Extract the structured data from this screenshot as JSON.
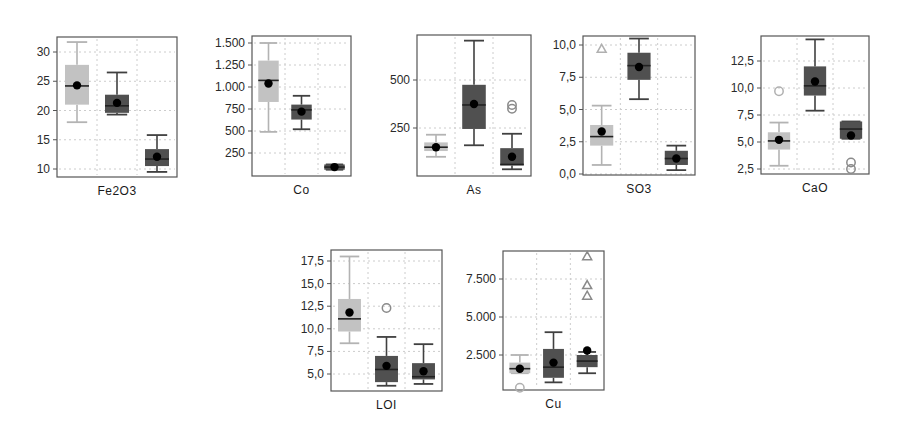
{
  "figure": {
    "width": 898,
    "height": 432,
    "background": "#ffffff",
    "colors": {
      "light_box": "#c2c2c2",
      "light_whisker": "#b3b3b3",
      "dark_box": "#505050",
      "dark_whisker": "#404040",
      "median": "#222222",
      "mean_dot": "#000000",
      "frame": "#555555",
      "grid": "#cccccc",
      "outlier_light": "#b0b0b0",
      "outlier_dark": "#8a8a8a"
    }
  },
  "chart_data": [
    {
      "type": "box",
      "title": "",
      "xlabel": "Fe2O3",
      "ylabel": "",
      "yticks": [
        10,
        15,
        20,
        25,
        30
      ],
      "ytick_labels": [
        "10",
        "15",
        "20",
        "25",
        "30"
      ],
      "ylim": [
        9,
        32.5
      ],
      "grid": true,
      "frame": {
        "x": 57,
        "y": 37,
        "w": 120,
        "h": 140
      },
      "scale": {
        "v0": 10,
        "y0": 169,
        "v1": 30,
        "y1": 52
      },
      "groups": [
        {
          "name": "group-1",
          "shade": "light",
          "whisker_low": 18,
          "q1": 21,
          "median": 24.2,
          "q3": 27.8,
          "whisker_high": 31.7,
          "mean": 24.3,
          "outliers": []
        },
        {
          "name": "group-2",
          "shade": "dark",
          "whisker_low": 19.3,
          "q1": 19.6,
          "median": 20.8,
          "q3": 22.7,
          "whisker_high": 26.5,
          "mean": 21.3,
          "outliers": []
        },
        {
          "name": "group-3",
          "shade": "dark",
          "whisker_low": 9.5,
          "q1": 10.5,
          "median": 11.7,
          "q3": 13.4,
          "whisker_high": 15.8,
          "mean": 12.1,
          "outliers": []
        }
      ]
    },
    {
      "type": "box",
      "xlabel": "Co",
      "ylabel": "",
      "yticks": [
        250,
        500,
        750,
        1000,
        1250,
        1500
      ],
      "ytick_labels": [
        "250",
        "500",
        "750",
        "1.000",
        "1.250",
        "1.500"
      ],
      "ylim": [
        0,
        1550
      ],
      "grid": true,
      "frame": {
        "x": 252,
        "y": 36,
        "w": 99,
        "h": 140
      },
      "scale": {
        "v0": 250,
        "y0": 153,
        "v1": 1500,
        "y1": 43
      },
      "groups": [
        {
          "name": "group-1",
          "shade": "light",
          "whisker_low": 490,
          "q1": 830,
          "median": 1075,
          "q3": 1300,
          "whisker_high": 1500,
          "mean": 1040,
          "outliers": []
        },
        {
          "name": "group-2",
          "shade": "dark",
          "whisker_low": 520,
          "q1": 630,
          "median": 740,
          "q3": 800,
          "whisker_high": 900,
          "mean": 720,
          "outliers": []
        },
        {
          "name": "group-3",
          "shade": "dark",
          "whisker_low": 60,
          "q1": 60,
          "median": 90,
          "q3": 120,
          "whisker_high": 120,
          "mean": 90,
          "outliers": []
        }
      ]
    },
    {
      "type": "box",
      "xlabel": "As",
      "ylabel": "",
      "yticks": [
        250,
        500
      ],
      "ytick_labels": [
        "250",
        "500"
      ],
      "ylim": [
        0,
        720
      ],
      "grid": true,
      "frame": {
        "x": 417,
        "y": 35,
        "w": 114,
        "h": 141
      },
      "scale": {
        "v0": 250,
        "y0": 128,
        "v1": 500,
        "y1": 80
      },
      "groups": [
        {
          "name": "group-1",
          "shade": "light",
          "whisker_low": 100,
          "q1": 130,
          "median": 150,
          "q3": 175,
          "whisker_high": 215,
          "mean": 150,
          "outliers": []
        },
        {
          "name": "group-2",
          "shade": "dark",
          "whisker_low": 160,
          "q1": 245,
          "median": 370,
          "q3": 475,
          "whisker_high": 705,
          "mean": 375,
          "outliers": []
        },
        {
          "name": "group-3",
          "shade": "dark",
          "whisker_low": 35,
          "q1": 55,
          "median": 60,
          "q3": 145,
          "whisker_high": 220,
          "mean": 100,
          "outliers": [
            {
              "value": 350,
              "shape": "circle"
            },
            {
              "value": 370,
              "shape": "circle"
            }
          ]
        }
      ]
    },
    {
      "type": "box",
      "xlabel": "SO3",
      "ylabel": "",
      "yticks": [
        0,
        2.5,
        5,
        7.5,
        10
      ],
      "ytick_labels": [
        "0,0",
        "2,5",
        "5,0",
        "7,5",
        "10,0"
      ],
      "ylim": [
        0,
        10.6
      ],
      "grid": true,
      "frame": {
        "x": 583,
        "y": 36,
        "w": 112,
        "h": 139
      },
      "scale": {
        "v0": 0,
        "y0": 174,
        "v1": 10,
        "y1": 45
      },
      "groups": [
        {
          "name": "group-1",
          "shade": "light",
          "whisker_low": 0.7,
          "q1": 2.2,
          "median": 2.9,
          "q3": 3.8,
          "whisker_high": 5.3,
          "mean": 3.3,
          "outliers": [
            {
              "value": 9.7,
              "shape": "triangle"
            }
          ]
        },
        {
          "name": "group-2",
          "shade": "dark",
          "whisker_low": 5.8,
          "q1": 7.3,
          "median": 8.4,
          "q3": 9.4,
          "whisker_high": 10.5,
          "mean": 8.3,
          "outliers": []
        },
        {
          "name": "group-3",
          "shade": "dark",
          "whisker_low": 0.3,
          "q1": 0.7,
          "median": 1.2,
          "q3": 1.8,
          "whisker_high": 2.2,
          "mean": 1.2,
          "outliers": []
        }
      ]
    },
    {
      "type": "box",
      "xlabel": "CaO",
      "ylabel": "",
      "yticks": [
        2.5,
        5,
        7.5,
        10,
        12.5
      ],
      "ytick_labels": [
        "2,5",
        "5,0",
        "7,5",
        "10,0",
        "12,5"
      ],
      "ylim": [
        2.2,
        14.8
      ],
      "grid": true,
      "frame": {
        "x": 761,
        "y": 36,
        "w": 108,
        "h": 138
      },
      "scale": {
        "v0": 2.5,
        "y0": 169,
        "v1": 12.5,
        "y1": 61
      },
      "groups": [
        {
          "name": "group-1",
          "shade": "light",
          "whisker_low": 2.8,
          "q1": 4.3,
          "median": 5.1,
          "q3": 5.9,
          "whisker_high": 6.8,
          "mean": 5.2,
          "outliers": [
            {
              "value": 9.7,
              "shape": "circle"
            }
          ]
        },
        {
          "name": "group-2",
          "shade": "dark",
          "whisker_low": 7.9,
          "q1": 9.3,
          "median": 10.2,
          "q3": 12.0,
          "whisker_high": 14.5,
          "mean": 10.6,
          "outliers": []
        },
        {
          "name": "group-3",
          "shade": "dark",
          "whisker_low": 5.3,
          "q1": 5.3,
          "median": 6.2,
          "q3": 6.9,
          "whisker_high": 6.9,
          "mean": 5.6,
          "outliers": [
            {
              "value": 3.1,
              "shape": "circle"
            },
            {
              "value": 2.5,
              "shape": "circle"
            }
          ]
        }
      ]
    },
    {
      "type": "box",
      "xlabel": "LOI",
      "ylabel": "",
      "yticks": [
        5,
        7.5,
        10,
        12.5,
        15,
        17.5
      ],
      "ytick_labels": [
        "5,0",
        "7,5",
        "10,0",
        "12,5",
        "15,0",
        "17,5"
      ],
      "ylim": [
        3.5,
        18.5
      ],
      "grid": true,
      "frame": {
        "x": 331,
        "y": 250,
        "w": 111,
        "h": 141
      },
      "scale": {
        "v0": 5,
        "y0": 374,
        "v1": 17.5,
        "y1": 261
      },
      "groups": [
        {
          "name": "group-1",
          "shade": "light",
          "whisker_low": 8.4,
          "q1": 9.7,
          "median": 11.1,
          "q3": 13.3,
          "whisker_high": 18.0,
          "mean": 11.8,
          "outliers": []
        },
        {
          "name": "group-2",
          "shade": "dark",
          "whisker_low": 3.7,
          "q1": 4.1,
          "median": 5.5,
          "q3": 7.0,
          "whisker_high": 9.1,
          "mean": 5.9,
          "outliers": [
            {
              "value": 12.3,
              "shape": "circle"
            }
          ]
        },
        {
          "name": "group-3",
          "shade": "dark",
          "whisker_low": 3.9,
          "q1": 4.4,
          "median": 4.7,
          "q3": 6.2,
          "whisker_high": 8.3,
          "mean": 5.3,
          "outliers": []
        }
      ]
    },
    {
      "type": "box",
      "xlabel": "Cu",
      "ylabel": "",
      "yticks": [
        2500,
        5000,
        7500
      ],
      "ytick_labels": [
        "2.500",
        "5.000",
        "7.500"
      ],
      "ylim": [
        300,
        9300
      ],
      "grid": true,
      "frame": {
        "x": 503,
        "y": 251,
        "w": 101,
        "h": 139
      },
      "scale": {
        "v0": 2500,
        "y0": 355,
        "v1": 7500,
        "y1": 279
      },
      "groups": [
        {
          "name": "group-1",
          "shade": "light",
          "whisker_low": 1300,
          "q1": 1300,
          "median": 1600,
          "q3": 2000,
          "whisker_high": 2500,
          "mean": 1600,
          "outliers": [
            {
              "value": 350,
              "shape": "circle"
            }
          ]
        },
        {
          "name": "group-2",
          "shade": "dark",
          "whisker_low": 700,
          "q1": 1000,
          "median": 1700,
          "q3": 2900,
          "whisker_high": 4000,
          "mean": 2000,
          "outliers": []
        },
        {
          "name": "group-3",
          "shade": "dark",
          "whisker_low": 1300,
          "q1": 1700,
          "median": 2100,
          "q3": 2500,
          "whisker_high": 2700,
          "mean": 2800,
          "outliers": [
            {
              "value": 9000,
              "shape": "triangle"
            },
            {
              "value": 7100,
              "shape": "triangle"
            },
            {
              "value": 6400,
              "shape": "triangle"
            }
          ]
        }
      ]
    }
  ]
}
